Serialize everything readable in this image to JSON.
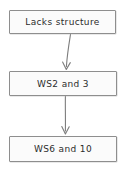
{
  "diagram": {
    "background_color": "#ffffff",
    "node_fill_color": "#fbfbfb",
    "node_border_color": "#8e8e8e",
    "text_color": "#2b2b2b",
    "connector_color": "#7d7d7d",
    "nodes": [
      {
        "id": "lacks-structure",
        "label": "Lacks structure"
      },
      {
        "id": "ws2-and-3",
        "label": "WS2 and 3"
      },
      {
        "id": "ws6-and-10",
        "label": "WS6 and 10"
      }
    ],
    "edges": [
      {
        "from": "lacks-structure",
        "to": "ws2-and-3",
        "arrowhead": "v-arrow"
      },
      {
        "from": "ws2-and-3",
        "to": "ws6-and-10",
        "arrowhead": "v-arrow"
      }
    ]
  }
}
